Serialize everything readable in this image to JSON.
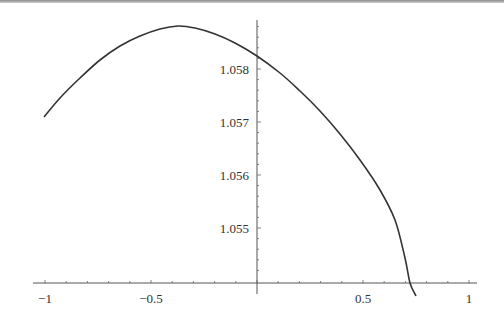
{
  "chart_data": {
    "type": "line",
    "title": "",
    "xlabel": "",
    "ylabel": "",
    "xlim": [
      -1.0,
      1.0
    ],
    "ylim": [
      1.054,
      1.0589
    ],
    "grid": false,
    "legend": null,
    "x_ticks": [
      {
        "value": -1,
        "label": "−1"
      },
      {
        "value": -0.5,
        "label": "−0.5"
      },
      {
        "value": 0.5,
        "label": "0.5"
      },
      {
        "value": 1,
        "label": "1"
      }
    ],
    "y_ticks": [
      {
        "value": 1.055,
        "label": "1.055"
      },
      {
        "value": 1.056,
        "label": "1.056"
      },
      {
        "value": 1.057,
        "label": "1.057"
      },
      {
        "value": 1.058,
        "label": "1.058"
      }
    ],
    "series": [
      {
        "name": "curve",
        "color": "#333333",
        "x": [
          -1.0,
          -0.9,
          -0.8,
          -0.7,
          -0.6,
          -0.5,
          -0.4,
          -0.37,
          -0.3,
          -0.2,
          -0.1,
          0.0,
          0.1,
          0.2,
          0.3,
          0.4,
          0.5,
          0.6,
          0.7,
          0.72,
          0.74
        ],
        "y": [
          1.05709,
          1.05767,
          1.05812,
          1.05844,
          1.05866,
          1.05879,
          1.05884,
          1.05885,
          1.05882,
          1.05871,
          1.05852,
          1.05824,
          1.05785,
          1.05735,
          1.05672,
          1.05597,
          1.05507,
          1.05403,
          1.05285,
          1.054,
          1.05378
        ]
      }
    ]
  }
}
